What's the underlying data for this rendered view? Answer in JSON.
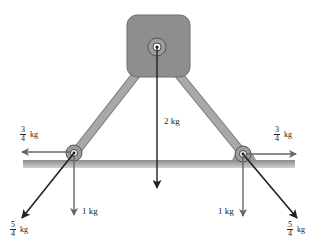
{
  "diagram": {
    "type": "free-body / force diagram",
    "top_mass": {
      "label": "2 kg",
      "force_direction": "down"
    },
    "left_joint": {
      "horizontal_force": {
        "numerator": "3",
        "denominator": "4",
        "unit": "kg",
        "direction": "left"
      },
      "diagonal_force": {
        "numerator": "5",
        "denominator": "4",
        "unit": "kg",
        "direction": "down-left"
      },
      "vertical_force": {
        "label": "1 kg",
        "direction": "down"
      }
    },
    "right_joint": {
      "horizontal_force": {
        "numerator": "3",
        "denominator": "4",
        "unit": "kg",
        "direction": "right"
      },
      "diagonal_force": {
        "numerator": "5",
        "denominator": "4",
        "unit": "kg",
        "direction": "down-right"
      },
      "vertical_force": {
        "label": "1 kg",
        "direction": "down"
      }
    },
    "colors": {
      "block": "#8e8e8e",
      "strut": "#9a9a9a",
      "ground": "#b0b0b0",
      "arrow_gray": "#666666",
      "arrow_dark": "#222222"
    }
  }
}
